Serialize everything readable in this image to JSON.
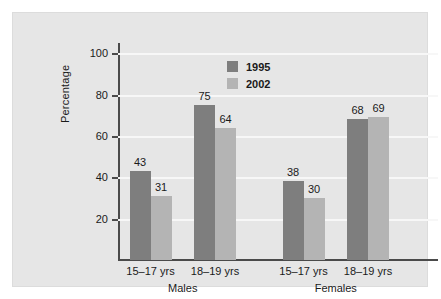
{
  "chart_data": {
    "type": "bar",
    "title": "",
    "subtitle": "",
    "xlabel": "",
    "ylabel": "Percentage",
    "ylim": [
      0,
      105
    ],
    "yticks": [
      20,
      40,
      60,
      80,
      100
    ],
    "ytick_labels": [
      "20",
      "40",
      "60",
      "80",
      "100"
    ],
    "grid": true,
    "legend_position": "top-center",
    "categories": [
      "15–17 yrs",
      "18–19 yrs",
      "15–17 yrs",
      "18–19 yrs"
    ],
    "groups": [
      {
        "name": "Males",
        "categories": [
          "15–17 yrs",
          "18–19 yrs"
        ]
      },
      {
        "name": "Females",
        "categories": [
          "15–17 yrs",
          "18–19 yrs"
        ]
      }
    ],
    "series": [
      {
        "name": "1995",
        "color": "#7e7e7e",
        "values": [
          43,
          75,
          38,
          68
        ]
      },
      {
        "name": "2002",
        "color": "#b4b4b4",
        "values": [
          31,
          64,
          30,
          69
        ]
      }
    ]
  },
  "legend": {
    "items": [
      {
        "label": "1995",
        "color": "#7e7e7e"
      },
      {
        "label": "2002",
        "color": "#b4b4b4"
      }
    ]
  },
  "axes": {
    "y_label": "Percentage",
    "y_ticks": [
      "100",
      "80",
      "60",
      "40",
      "20"
    ]
  },
  "bars": [
    {
      "value_label": "43",
      "series": "1995",
      "group": "Males",
      "category": "15–17 yrs"
    },
    {
      "value_label": "31",
      "series": "2002",
      "group": "Males",
      "category": "15–17 yrs"
    },
    {
      "value_label": "75",
      "series": "1995",
      "group": "Males",
      "category": "18–19 yrs"
    },
    {
      "value_label": "64",
      "series": "2002",
      "group": "Males",
      "category": "18–19 yrs"
    },
    {
      "value_label": "38",
      "series": "1995",
      "group": "Females",
      "category": "15–17 yrs"
    },
    {
      "value_label": "30",
      "series": "2002",
      "group": "Females",
      "category": "15–17 yrs"
    },
    {
      "value_label": "68",
      "series": "1995",
      "group": "Females",
      "category": "18–19 yrs"
    },
    {
      "value_label": "69",
      "series": "2002",
      "group": "Females",
      "category": "18–19 yrs"
    }
  ],
  "category_labels": [
    "15–17 yrs",
    "18–19 yrs",
    "15–17 yrs",
    "18–19 yrs"
  ],
  "group_labels": [
    "Males",
    "Females"
  ],
  "colors": {
    "series_1995": "#7e7e7e",
    "series_2002": "#b4b4b4",
    "panel_background": "#e6e6e6",
    "gridline": "#f7f7f7",
    "axis": "#4a4a4a",
    "text": "#1a1a1a"
  }
}
